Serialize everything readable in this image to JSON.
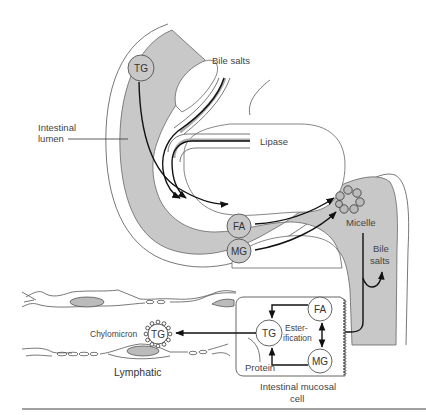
{
  "figure": {
    "type": "physiology-diagram"
  },
  "labels": {
    "bile_salts_top": "Bile salts",
    "lipase": "Lipase",
    "intestinal_lumen_line1": "Intestinal",
    "intestinal_lumen_line2": "lumen",
    "micelle": "Micelle",
    "bile_salts_right_line1": "Bile",
    "bile_salts_right_line2": "salts",
    "chylomicron": "Chylomicron",
    "lymphatic": "Lymphatic",
    "esterification_line1": "Ester-",
    "esterification_line2": "ification",
    "protein": "Protein",
    "mucosal_cell_line1": "Intestinal mucosal",
    "mucosal_cell_line2": "cell"
  },
  "nodes": {
    "lumen_tg": "TG",
    "lumen_fa": "FA",
    "lumen_mg": "MG",
    "cell_fa": "FA",
    "cell_tg": "TG",
    "cell_mg": "MG",
    "chylomicron_tg": "TG"
  },
  "flows": [
    {
      "from": "TG (lumen)",
      "to": "FA / MG",
      "via": "Lipase + Bile salts"
    },
    {
      "from": "FA",
      "to": "Micelle"
    },
    {
      "from": "MG",
      "to": "Micelle"
    },
    {
      "from": "Micelle",
      "to": "Intestinal mucosal cell"
    },
    {
      "from": "Micelle",
      "to": "Bile salts (recycled)"
    },
    {
      "from": "FA + MG (cell)",
      "to": "TG",
      "via": "Esterification"
    },
    {
      "from": "TG + Protein",
      "to": "Chylomicron"
    },
    {
      "from": "Chylomicron",
      "to": "Lymphatic"
    }
  ],
  "colors": {
    "lumen_fill": "#c8c8c8",
    "outline": "#555555",
    "arrow": "#111111",
    "text": "#444444"
  }
}
